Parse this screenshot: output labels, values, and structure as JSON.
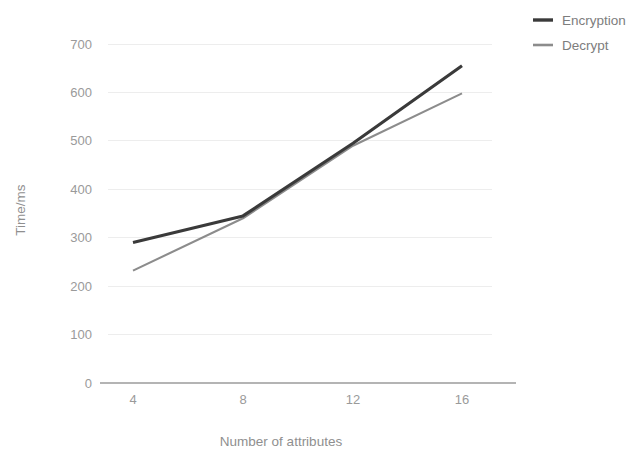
{
  "chart_data": {
    "type": "line",
    "title": "",
    "xlabel": "Number of attributes",
    "ylabel": "Time/ms",
    "x": [
      4,
      8,
      12,
      16
    ],
    "categories": [
      "4",
      "8",
      "12",
      "16"
    ],
    "series": [
      {
        "name": "Encryption",
        "values": [
          290,
          345,
          495,
          655
        ],
        "color": "#3a3a3a"
      },
      {
        "name": "Decrypt",
        "values": [
          232,
          340,
          490,
          598
        ],
        "color": "#8c8c8c"
      }
    ],
    "xlim": [
      2,
      18
    ],
    "ylim": [
      0,
      700
    ],
    "yticks": [
      0,
      100,
      200,
      300,
      400,
      500,
      600,
      700
    ],
    "ytick_labels": [
      "0",
      "100",
      "200",
      "300",
      "400",
      "500",
      "600",
      "700"
    ],
    "xtick_labels": [
      "4",
      "8",
      "12",
      "16"
    ],
    "grid": "horizontal",
    "legend_position": "top-right",
    "background_color": "#ffffff",
    "gridline_color": "#ededed",
    "axis_color": "#b4b4b4"
  },
  "axes": {
    "y_title": "Time/ms",
    "x_title": "Number of attributes",
    "y_ticks": [
      {
        "label": "700"
      },
      {
        "label": "600"
      },
      {
        "label": "500"
      },
      {
        "label": "400"
      },
      {
        "label": "300"
      },
      {
        "label": "200"
      },
      {
        "label": "100"
      },
      {
        "label": "0"
      }
    ],
    "x_ticks": [
      {
        "label": "4"
      },
      {
        "label": "8"
      },
      {
        "label": "12"
      },
      {
        "label": "16"
      }
    ]
  },
  "legend": {
    "items": [
      {
        "label": "Encryption",
        "color": "#3a3a3a"
      },
      {
        "label": "Decrypt",
        "color": "#8c8c8c"
      }
    ]
  }
}
